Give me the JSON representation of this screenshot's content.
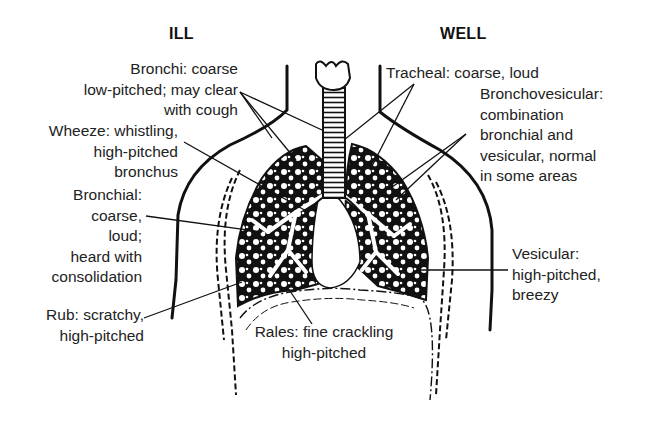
{
  "diagram": {
    "title_left": "ILL",
    "title_right": "WELL",
    "colors": {
      "ink": "#111111",
      "text": "#222222",
      "background": "#ffffff"
    },
    "labels": {
      "bronchi": [
        "Bronchi: coarse",
        "low-pitched; may clear",
        "with cough"
      ],
      "wheeze": [
        "Wheeze: whistling,",
        "high-pitched",
        "bronchus"
      ],
      "bronchial": [
        "Bronchial:",
        "coarse,",
        "loud;",
        "heard with",
        "consolidation"
      ],
      "rub": [
        "Rub: scratchy,",
        "high-pitched"
      ],
      "rales": [
        "Rales: fine crackling",
        "high-pitched"
      ],
      "tracheal": [
        "Tracheal: coarse, loud"
      ],
      "bronchovesicular": [
        "Bronchovesicular:",
        "combination",
        "bronchial and",
        "vesicular, normal",
        "in some areas"
      ],
      "vesicular": [
        "Vesicular:",
        "high-pitched,",
        "breezy"
      ]
    }
  }
}
